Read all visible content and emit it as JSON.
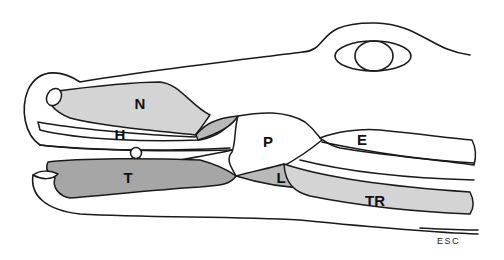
{
  "diagram": {
    "colors": {
      "outline": "#1a1a1a",
      "fill_light": "#d4d4d4",
      "fill_mid": "#b9b9b9",
      "fill_dark": "#a6a6a6",
      "background": "#ffffff"
    },
    "labels": [
      {
        "id": "N",
        "text": "N",
        "x": 140,
        "y": 103
      },
      {
        "id": "H",
        "text": "H",
        "x": 120,
        "y": 134
      },
      {
        "id": "O",
        "text": "O",
        "x": 136,
        "y": 153
      },
      {
        "id": "T",
        "text": "T",
        "x": 128,
        "y": 176
      },
      {
        "id": "P",
        "text": "P",
        "x": 268,
        "y": 141
      },
      {
        "id": "E",
        "text": "E",
        "x": 362,
        "y": 138
      },
      {
        "id": "L",
        "text": "L",
        "x": 281,
        "y": 176
      },
      {
        "id": "TR",
        "text": "TR",
        "x": 375,
        "y": 199
      }
    ],
    "signature": "ESC"
  }
}
